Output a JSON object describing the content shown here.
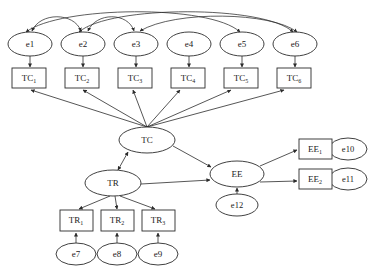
{
  "diagram": {
    "type": "sem-path-diagram",
    "stroke_color": "#2b2b2b",
    "fill_color": "#ffffff"
  },
  "latent_variables": [
    {
      "id": "TC",
      "label": "TC",
      "cx": 147,
      "cy": 140,
      "rx": 28,
      "ry": 13
    },
    {
      "id": "TR",
      "label": "TR",
      "cx": 113,
      "cy": 183,
      "rx": 28,
      "ry": 13
    },
    {
      "id": "EE",
      "label": "EE",
      "cx": 237,
      "cy": 174,
      "rx": 27,
      "ry": 13
    }
  ],
  "indicators": [
    {
      "id": "TC1",
      "base": "TC",
      "sub": "1",
      "x": 12,
      "y": 68,
      "w": 34,
      "h": 20
    },
    {
      "id": "TC2",
      "base": "TC",
      "sub": "2",
      "x": 65,
      "y": 68,
      "w": 34,
      "h": 20
    },
    {
      "id": "TC3",
      "base": "TC",
      "sub": "3",
      "x": 118,
      "y": 68,
      "w": 34,
      "h": 20
    },
    {
      "id": "TC4",
      "base": "TC",
      "sub": "4",
      "x": 171,
      "y": 68,
      "w": 34,
      "h": 20
    },
    {
      "id": "TC5",
      "base": "TC",
      "sub": "5",
      "x": 224,
      "y": 68,
      "w": 34,
      "h": 20
    },
    {
      "id": "TC6",
      "base": "TC",
      "sub": "6",
      "x": 277,
      "y": 68,
      "w": 34,
      "h": 20
    },
    {
      "id": "TR1",
      "base": "TR",
      "sub": "1",
      "x": 60,
      "y": 210,
      "w": 33,
      "h": 21
    },
    {
      "id": "TR2",
      "base": "TR",
      "sub": "2",
      "x": 101,
      "y": 210,
      "w": 33,
      "h": 21
    },
    {
      "id": "TR3",
      "base": "TR",
      "sub": "3",
      "x": 142,
      "y": 210,
      "w": 33,
      "h": 21
    },
    {
      "id": "EE1",
      "base": "EE",
      "sub": "1",
      "x": 299,
      "y": 139,
      "w": 33,
      "h": 20
    },
    {
      "id": "EE2",
      "base": "EE",
      "sub": "2",
      "x": 299,
      "y": 169,
      "w": 33,
      "h": 20
    }
  ],
  "error_terms": [
    {
      "id": "e1",
      "label": "e1",
      "cx": 30,
      "cy": 44,
      "rx": 22,
      "ry": 12
    },
    {
      "id": "e2",
      "label": "e2",
      "cx": 83,
      "cy": 44,
      "rx": 22,
      "ry": 12
    },
    {
      "id": "e3",
      "label": "e3",
      "cx": 136,
      "cy": 44,
      "rx": 22,
      "ry": 12
    },
    {
      "id": "e4",
      "label": "e4",
      "cx": 189,
      "cy": 44,
      "rx": 22,
      "ry": 12
    },
    {
      "id": "e5",
      "label": "e5",
      "cx": 242,
      "cy": 44,
      "rx": 22,
      "ry": 12
    },
    {
      "id": "e6",
      "label": "e6",
      "cx": 295,
      "cy": 44,
      "rx": 22,
      "ry": 12
    },
    {
      "id": "e7",
      "label": "e7",
      "cx": 76,
      "cy": 254,
      "rx": 20,
      "ry": 11
    },
    {
      "id": "e8",
      "label": "e8",
      "cx": 117,
      "cy": 254,
      "rx": 20,
      "ry": 11
    },
    {
      "id": "e9",
      "label": "e9",
      "cx": 158,
      "cy": 254,
      "rx": 20,
      "ry": 11
    },
    {
      "id": "e10",
      "label": "e10",
      "cx": 348,
      "cy": 149,
      "rx": 19,
      "ry": 11
    },
    {
      "id": "e11",
      "label": "e11",
      "cx": 348,
      "cy": 179,
      "rx": 19,
      "ry": 11
    },
    {
      "id": "e12",
      "label": "e12",
      "cx": 237,
      "cy": 205,
      "rx": 21,
      "ry": 11
    }
  ],
  "directed_paths": [
    {
      "from": "TC",
      "to": "TC1"
    },
    {
      "from": "TC",
      "to": "TC2"
    },
    {
      "from": "TC",
      "to": "TC3"
    },
    {
      "from": "TC",
      "to": "TC4"
    },
    {
      "from": "TC",
      "to": "TC5"
    },
    {
      "from": "TC",
      "to": "TC6"
    },
    {
      "from": "TR",
      "to": "TR1"
    },
    {
      "from": "TR",
      "to": "TR2"
    },
    {
      "from": "TR",
      "to": "TR3"
    },
    {
      "from": "EE",
      "to": "EE1"
    },
    {
      "from": "EE",
      "to": "EE2"
    },
    {
      "from": "TC",
      "to": "EE"
    },
    {
      "from": "TR",
      "to": "EE"
    },
    {
      "from": "e1",
      "to": "TC1"
    },
    {
      "from": "e2",
      "to": "TC2"
    },
    {
      "from": "e3",
      "to": "TC3"
    },
    {
      "from": "e4",
      "to": "TC4"
    },
    {
      "from": "e5",
      "to": "TC5"
    },
    {
      "from": "e6",
      "to": "TC6"
    },
    {
      "from": "e7",
      "to": "TR1"
    },
    {
      "from": "e8",
      "to": "TR2"
    },
    {
      "from": "e9",
      "to": "TR3"
    },
    {
      "from": "e10",
      "to": "EE1"
    },
    {
      "from": "e11",
      "to": "EE2"
    },
    {
      "from": "e12",
      "to": "EE"
    }
  ],
  "covariance_arcs": [
    {
      "between": [
        "e1",
        "e2"
      ]
    },
    {
      "between": [
        "e2",
        "e3"
      ]
    },
    {
      "between": [
        "e1",
        "e5"
      ]
    },
    {
      "between": [
        "e2",
        "e6"
      ]
    },
    {
      "between": [
        "e3",
        "e6"
      ]
    }
  ],
  "bidirectional_paths": [
    {
      "between": [
        "TC",
        "TR"
      ]
    }
  ]
}
